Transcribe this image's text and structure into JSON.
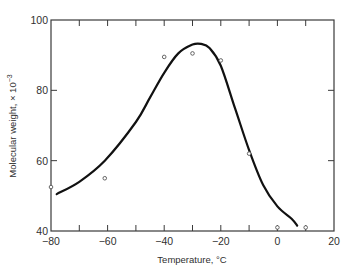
{
  "chart_data": {
    "type": "scatter",
    "title": "",
    "xlabel": "Temperature, °C",
    "ylabel": "Molecular weight, × 10⁻³",
    "xlim": [
      -80,
      20
    ],
    "ylim": [
      40,
      100
    ],
    "x_ticks": [
      -80,
      -60,
      -40,
      -20,
      0,
      20
    ],
    "x_minor_ticks": [
      -70,
      -50,
      -30,
      -10,
      10
    ],
    "y_ticks": [
      40,
      60,
      80,
      100
    ],
    "grid": false,
    "legend": null,
    "series": [
      {
        "name": "measured",
        "kind": "points",
        "marker": "open-circle",
        "x": [
          -80,
          -61,
          -40,
          -30,
          -20,
          -10,
          0,
          10
        ],
        "y": [
          52.5,
          55,
          89.5,
          90.5,
          88.5,
          62,
          41,
          41
        ]
      },
      {
        "name": "fitted curve",
        "kind": "smooth-line",
        "x": [
          -78,
          -70,
          -61,
          -50,
          -45,
          -40,
          -35,
          -30,
          -27,
          -24,
          -20,
          -15,
          -10,
          -5,
          0,
          5,
          7
        ],
        "y": [
          50.5,
          54,
          60,
          71,
          78,
          85,
          90.5,
          93,
          93.2,
          92,
          87,
          75,
          63,
          53,
          47,
          43.5,
          41.5
        ]
      }
    ]
  },
  "axes": {
    "x_tick_labels": [
      "−80",
      "−60",
      "−40",
      "−20",
      "0",
      "20"
    ],
    "y_tick_labels": [
      "40",
      "60",
      "80",
      "100"
    ]
  },
  "colors": {
    "axis": "#3a3a3a",
    "curve": "#111111",
    "marker": "#555555"
  }
}
